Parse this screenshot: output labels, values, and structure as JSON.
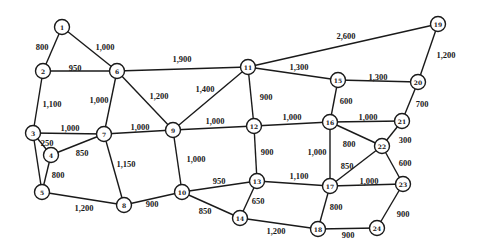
{
  "diagram": {
    "title": "",
    "type": "weighted-network",
    "colors": {
      "line": "#1a1a1a",
      "node_fill": "#ffffff",
      "background": "#ffffff"
    },
    "nodes": [
      {
        "id": "1",
        "x": 62,
        "y": 27
      },
      {
        "id": "2",
        "x": 43,
        "y": 71
      },
      {
        "id": "3",
        "x": 33,
        "y": 133
      },
      {
        "id": "4",
        "x": 51,
        "y": 155
      },
      {
        "id": "5",
        "x": 42,
        "y": 192
      },
      {
        "id": "6",
        "x": 117,
        "y": 71
      },
      {
        "id": "7",
        "x": 104,
        "y": 134
      },
      {
        "id": "8",
        "x": 124,
        "y": 205
      },
      {
        "id": "9",
        "x": 173,
        "y": 130
      },
      {
        "id": "10",
        "x": 182,
        "y": 192
      },
      {
        "id": "11",
        "x": 248,
        "y": 67
      },
      {
        "id": "12",
        "x": 254,
        "y": 126
      },
      {
        "id": "13",
        "x": 257,
        "y": 181
      },
      {
        "id": "14",
        "x": 240,
        "y": 218
      },
      {
        "id": "15",
        "x": 338,
        "y": 80
      },
      {
        "id": "16",
        "x": 330,
        "y": 122
      },
      {
        "id": "17",
        "x": 330,
        "y": 186
      },
      {
        "id": "18",
        "x": 318,
        "y": 229
      },
      {
        "id": "19",
        "x": 438,
        "y": 24
      },
      {
        "id": "20",
        "x": 418,
        "y": 82
      },
      {
        "id": "21",
        "x": 402,
        "y": 121
      },
      {
        "id": "22",
        "x": 382,
        "y": 146
      },
      {
        "id": "23",
        "x": 403,
        "y": 184
      },
      {
        "id": "24",
        "x": 377,
        "y": 228
      }
    ],
    "edges": [
      {
        "from": "1",
        "to": "2",
        "label": "800",
        "lx": 42,
        "ly": 47
      },
      {
        "from": "1",
        "to": "6",
        "label": "1,000",
        "lx": 105,
        "ly": 47
      },
      {
        "from": "2",
        "to": "6",
        "label": "950",
        "lx": 75,
        "ly": 68
      },
      {
        "from": "2",
        "to": "3",
        "label": "1,100",
        "lx": 52,
        "ly": 104
      },
      {
        "from": "6",
        "to": "7",
        "label": "1,000",
        "lx": 99,
        "ly": 100
      },
      {
        "from": "6",
        "to": "11",
        "label": "1,900",
        "lx": 182,
        "ly": 59
      },
      {
        "from": "6",
        "to": "9",
        "label": "1,200",
        "lx": 159,
        "ly": 96
      },
      {
        "from": "3",
        "to": "7",
        "label": "1,000",
        "lx": 70,
        "ly": 128
      },
      {
        "from": "3",
        "to": "4",
        "label": "250",
        "lx": 47,
        "ly": 143
      },
      {
        "from": "3",
        "to": "5",
        "label": "",
        "lx": 0,
        "ly": 0
      },
      {
        "from": "4",
        "to": "7",
        "label": "850",
        "lx": 82,
        "ly": 153
      },
      {
        "from": "4",
        "to": "5",
        "label": "800",
        "lx": 58,
        "ly": 175
      },
      {
        "from": "5",
        "to": "8",
        "label": "1,200",
        "lx": 84,
        "ly": 208
      },
      {
        "from": "7",
        "to": "9",
        "label": "1,000",
        "lx": 140,
        "ly": 127
      },
      {
        "from": "7",
        "to": "8",
        "label": "1,150",
        "lx": 126,
        "ly": 164
      },
      {
        "from": "8",
        "to": "10",
        "label": "900",
        "lx": 152,
        "ly": 204
      },
      {
        "from": "9",
        "to": "11",
        "label": "1,400",
        "lx": 205,
        "ly": 89
      },
      {
        "from": "9",
        "to": "12",
        "label": "1,000",
        "lx": 215,
        "ly": 121
      },
      {
        "from": "9",
        "to": "10",
        "label": "1,000",
        "lx": 196,
        "ly": 159
      },
      {
        "from": "10",
        "to": "13",
        "label": "950",
        "lx": 219,
        "ly": 181
      },
      {
        "from": "10",
        "to": "14",
        "label": "850",
        "lx": 205,
        "ly": 211
      },
      {
        "from": "11",
        "to": "19",
        "label": "2,600",
        "lx": 346,
        "ly": 36
      },
      {
        "from": "11",
        "to": "15",
        "label": "1,300",
        "lx": 299,
        "ly": 67
      },
      {
        "from": "11",
        "to": "12",
        "label": "900",
        "lx": 266,
        "ly": 97
      },
      {
        "from": "12",
        "to": "16",
        "label": "1,000",
        "lx": 292,
        "ly": 117
      },
      {
        "from": "12",
        "to": "13",
        "label": "900",
        "lx": 267,
        "ly": 152
      },
      {
        "from": "13",
        "to": "17",
        "label": "1,100",
        "lx": 299,
        "ly": 176
      },
      {
        "from": "13",
        "to": "14",
        "label": "650",
        "lx": 258,
        "ly": 201
      },
      {
        "from": "14",
        "to": "18",
        "label": "1,200",
        "lx": 276,
        "ly": 231
      },
      {
        "from": "15",
        "to": "16",
        "label": "600",
        "lx": 346,
        "ly": 101
      },
      {
        "from": "15",
        "to": "20",
        "label": "1,300",
        "lx": 378,
        "ly": 77
      },
      {
        "from": "16",
        "to": "21",
        "label": "1,000",
        "lx": 368,
        "ly": 117
      },
      {
        "from": "16",
        "to": "22",
        "label": "800",
        "lx": 349,
        "ly": 144
      },
      {
        "from": "16",
        "to": "17",
        "label": "1,000",
        "lx": 317,
        "ly": 152
      },
      {
        "from": "17",
        "to": "22",
        "label": "850",
        "lx": 347,
        "ly": 166
      },
      {
        "from": "17",
        "to": "23",
        "label": "1,000",
        "lx": 369,
        "ly": 181
      },
      {
        "from": "17",
        "to": "18",
        "label": "800",
        "lx": 336,
        "ly": 207
      },
      {
        "from": "18",
        "to": "24",
        "label": "900",
        "lx": 348,
        "ly": 235
      },
      {
        "from": "19",
        "to": "20",
        "label": "1,200",
        "lx": 446,
        "ly": 55
      },
      {
        "from": "20",
        "to": "21",
        "label": "700",
        "lx": 422,
        "ly": 104
      },
      {
        "from": "21",
        "to": "22",
        "label": "300",
        "lx": 405,
        "ly": 140
      },
      {
        "from": "22",
        "to": "23",
        "label": "600",
        "lx": 405,
        "ly": 163
      },
      {
        "from": "23",
        "to": "24",
        "label": "900",
        "lx": 403,
        "ly": 214
      }
    ]
  }
}
